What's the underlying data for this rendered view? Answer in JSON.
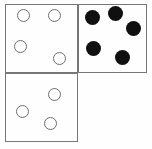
{
  "canvas": {
    "width": 152,
    "height": 149,
    "background_color": "#ffffff",
    "border_color": "#777777",
    "open_dot_fill": "#ffffff",
    "open_dot_stroke": "#6e6e6e",
    "filled_dot_color": "#101010"
  },
  "panels": [
    {
      "id": "top-left",
      "label": "top-left-panel",
      "x": 5,
      "y": 4,
      "width": 73,
      "height": 69,
      "dot_style": "open",
      "dot_count": 4,
      "dots": [
        {
          "cx": 23,
          "cy": 15,
          "r": 6.5
        },
        {
          "cx": 54,
          "cy": 15,
          "r": 6.5
        },
        {
          "cx": 20,
          "cy": 46,
          "r": 6.5
        },
        {
          "cx": 59,
          "cy": 58,
          "r": 6.5
        }
      ]
    },
    {
      "id": "top-right",
      "label": "top-right-panel",
      "x": 78,
      "y": 4,
      "width": 69,
      "height": 69,
      "dot_style": "filled",
      "dot_count": 5,
      "dots": [
        {
          "cx": 92,
          "cy": 17,
          "r": 7.5
        },
        {
          "cx": 115,
          "cy": 13,
          "r": 7.5
        },
        {
          "cx": 133,
          "cy": 28,
          "r": 7.5
        },
        {
          "cx": 93,
          "cy": 48,
          "r": 7.5
        },
        {
          "cx": 122,
          "cy": 57,
          "r": 7.5
        }
      ]
    },
    {
      "id": "bottom-left",
      "label": "bottom-left-panel",
      "x": 5,
      "y": 73,
      "width": 73,
      "height": 69,
      "dot_style": "open",
      "dot_count": 3,
      "dots": [
        {
          "cx": 54,
          "cy": 94,
          "r": 6.5
        },
        {
          "cx": 22,
          "cy": 111,
          "r": 6.5
        },
        {
          "cx": 50,
          "cy": 123,
          "r": 6.5
        }
      ]
    }
  ]
}
